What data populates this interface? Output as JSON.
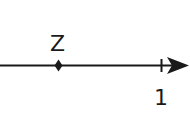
{
  "diagram": {
    "type": "number-line",
    "colors": {
      "stroke": "#1a1a1a",
      "background": "#ffffff"
    },
    "point": {
      "label": "Z",
      "marker": "dot"
    },
    "tick": {
      "label": "1"
    },
    "arrow": "right-arrowhead"
  }
}
